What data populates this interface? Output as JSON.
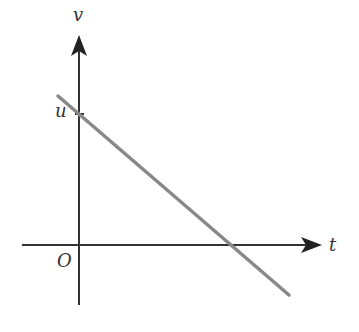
{
  "diagram": {
    "type": "velocity-time graph",
    "axes": {
      "x_label": "t",
      "y_label": "v",
      "origin_label": "O"
    },
    "intercept_label": "u",
    "line": {
      "description": "straight line with negative gradient, starting at v = u when t = 0, crossing the t-axis",
      "color": "#888888"
    },
    "axis_color": "#333333"
  }
}
